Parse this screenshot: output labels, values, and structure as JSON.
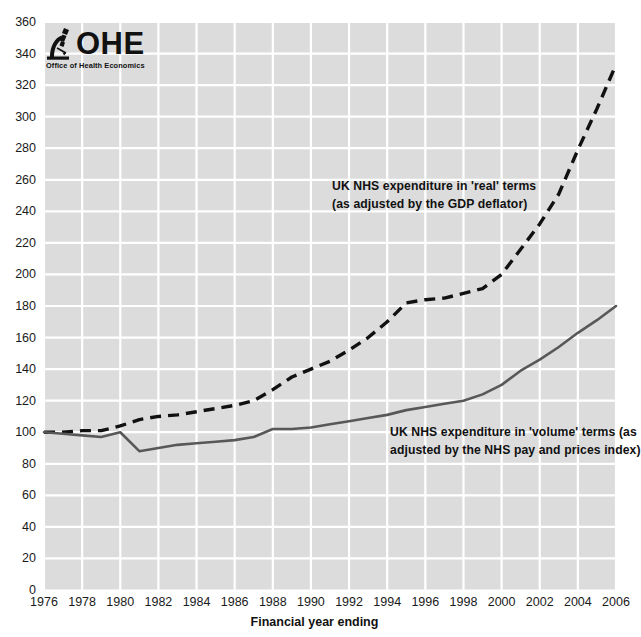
{
  "logo": {
    "mark_icon": "microscope-icon",
    "wordmark": "OHE",
    "subtitle": "Office of Health Economics"
  },
  "axes": {
    "x_title": "Financial year ending",
    "y_title": "",
    "y_ticks": [
      "0",
      "20",
      "40",
      "60",
      "80",
      "100",
      "120",
      "140",
      "160",
      "180",
      "200",
      "220",
      "240",
      "260",
      "280",
      "300",
      "320",
      "340",
      "360"
    ],
    "x_ticks": [
      "1976",
      "1978",
      "1980",
      "1982",
      "1984",
      "1986",
      "1988",
      "1990",
      "1992",
      "1994",
      "1996",
      "1998",
      "2000",
      "2002",
      "2004",
      "2006"
    ]
  },
  "annotations": {
    "real": "UK NHS expenditure in 'real' terms\n(as adjusted by the GDP deflator)",
    "volume": "UK NHS expenditure in 'volume' terms (as\nadjusted by the NHS pay and prices index)"
  },
  "colors": {
    "plot_background": "#dcdcdc",
    "gridline": "#ffffff",
    "real_series": "#111111",
    "volume_series": "#585858",
    "text": "#1a1a1a"
  },
  "chart_data": {
    "type": "line",
    "title": "",
    "subtitle": "",
    "xlabel": "Financial year ending",
    "ylabel": "",
    "xlim": [
      1976,
      2006
    ],
    "ylim": [
      0,
      360
    ],
    "y_tick_step": 20,
    "x_tick_step": 2,
    "grid": true,
    "legend": "annotations-inline",
    "x": [
      1976,
      1977,
      1978,
      1979,
      1980,
      1981,
      1982,
      1983,
      1984,
      1985,
      1986,
      1987,
      1988,
      1989,
      1990,
      1991,
      1992,
      1993,
      1994,
      1995,
      1996,
      1997,
      1998,
      1999,
      2000,
      2001,
      2002,
      2003,
      2004,
      2005,
      2006
    ],
    "series": [
      {
        "name": "UK NHS expenditure in 'real' terms (as adjusted by the GDP deflator)",
        "style": "dashed",
        "color": "#111111",
        "values": [
          100,
          100,
          101,
          101,
          104,
          108,
          110,
          111,
          113,
          115,
          117,
          120,
          127,
          135,
          140,
          145,
          152,
          160,
          170,
          182,
          184,
          185,
          188,
          191,
          200,
          216,
          232,
          251,
          279,
          305,
          333
        ]
      },
      {
        "name": "UK NHS expenditure in 'volume' terms (as adjusted by the NHS pay and prices index)",
        "style": "solid",
        "color": "#585858",
        "values": [
          100,
          99,
          98,
          97,
          100,
          88,
          90,
          92,
          93,
          94,
          95,
          97,
          102,
          102,
          103,
          105,
          107,
          109,
          111,
          114,
          116,
          118,
          120,
          124,
          130,
          139,
          146,
          154,
          163,
          171,
          180
        ]
      }
    ]
  }
}
